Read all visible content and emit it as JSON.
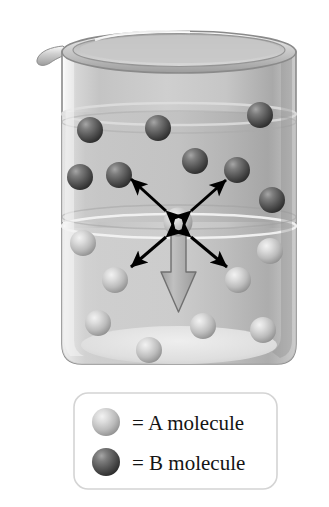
{
  "figure": {
    "background_color": "#ffffff"
  },
  "beaker": {
    "name": "beaker",
    "glass_color": "#c9c9c9",
    "glass_highlight": "#e8e8e8",
    "outline_color": "#8d8d8d",
    "rim_color": "#b6b6b6",
    "liquid_upper_band_color": "#b9b9b9",
    "liquid_lower_band_color": "#c4c4c4",
    "spout_label": "pouring-spout",
    "level_line_1_y": 118,
    "level_line_2_y": 225,
    "bottom_ellipse_color": "#e3e3e3"
  },
  "molecules": {
    "a_color_light": "#d8d8d8",
    "a_color_mid": "#b4b4b4",
    "a_color_dark": "#8a8a8a",
    "b_color_light": "#8f8f8f",
    "b_color_mid": "#5e5e5e",
    "b_color_dark": "#2d2d2d",
    "radius": 13,
    "b_positions": [
      {
        "label": "b-molecule-1",
        "x": 90,
        "y": 130
      },
      {
        "label": "b-molecule-2",
        "x": 158,
        "y": 128
      },
      {
        "label": "b-molecule-3",
        "x": 260,
        "y": 115
      },
      {
        "label": "b-molecule-4",
        "x": 80,
        "y": 177
      },
      {
        "label": "b-molecule-5",
        "x": 119,
        "y": 175
      },
      {
        "label": "b-molecule-6",
        "x": 195,
        "y": 161
      },
      {
        "label": "b-molecule-7",
        "x": 237,
        "y": 170
      },
      {
        "label": "b-molecule-8",
        "x": 272,
        "y": 200
      }
    ],
    "a_positions": [
      {
        "label": "a-molecule-center",
        "x": 178,
        "y": 222
      },
      {
        "label": "a-molecule-1",
        "x": 83,
        "y": 243
      },
      {
        "label": "a-molecule-2",
        "x": 270,
        "y": 251
      },
      {
        "label": "a-molecule-3",
        "x": 115,
        "y": 280
      },
      {
        "label": "a-molecule-4",
        "x": 238,
        "y": 280
      },
      {
        "label": "a-molecule-5",
        "x": 98,
        "y": 323
      },
      {
        "label": "a-molecule-6",
        "x": 203,
        "y": 326
      },
      {
        "label": "a-molecule-7",
        "x": 263,
        "y": 330
      },
      {
        "label": "a-molecule-8",
        "x": 149,
        "y": 350
      }
    ]
  },
  "arrows": {
    "color": "#000000",
    "double_headed": [
      {
        "label": "arrow-upper-left",
        "x1": 166,
        "y1": 211,
        "x2": 131,
        "y2": 179
      },
      {
        "label": "arrow-upper-right",
        "x1": 191,
        "y1": 211,
        "x2": 226,
        "y2": 180
      },
      {
        "label": "arrow-lower-left",
        "x1": 166,
        "y1": 237,
        "x2": 131,
        "y2": 267
      },
      {
        "label": "arrow-lower-right",
        "x1": 191,
        "y1": 237,
        "x2": 227,
        "y2": 267
      }
    ],
    "big_arrow": {
      "label": "net-diffusion-arrow",
      "direction": "down",
      "fill": "#b0b0b0",
      "stroke": "#6f6f6f",
      "x": 178,
      "top_y": 230,
      "tip_y": 312
    }
  },
  "legend": {
    "name": "legend-box",
    "border_color": "#d2d2d2",
    "background_color": "#ffffff",
    "box": {
      "x": 74,
      "y": 393,
      "width": 203,
      "height": 96
    },
    "items": [
      {
        "key": "a",
        "swatch": "a-molecule-swatch",
        "label": "= A molecule"
      },
      {
        "key": "b",
        "swatch": "b-molecule-swatch",
        "label": "= B molecule"
      }
    ]
  }
}
